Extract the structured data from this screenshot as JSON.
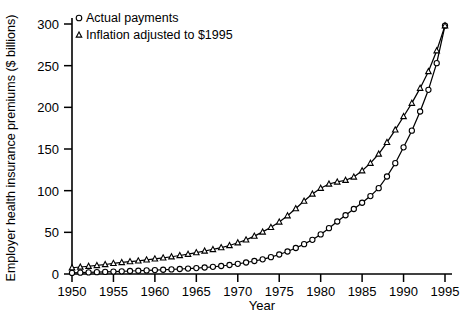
{
  "chart_data": {
    "type": "line",
    "title": "",
    "xlabel": "Year",
    "ylabel": "Employer health insurance premiums ($ billions)",
    "xlim": [
      1950,
      1995
    ],
    "ylim": [
      0,
      300
    ],
    "xticks": [
      1950,
      1955,
      1960,
      1965,
      1970,
      1975,
      1980,
      1985,
      1990,
      1995
    ],
    "yticks": [
      0,
      50,
      100,
      150,
      200,
      250,
      300
    ],
    "grid": false,
    "legend_position": "top-left",
    "x": [
      1950,
      1951,
      1952,
      1953,
      1954,
      1955,
      1956,
      1957,
      1958,
      1959,
      1960,
      1961,
      1962,
      1963,
      1964,
      1965,
      1966,
      1967,
      1968,
      1969,
      1970,
      1971,
      1972,
      1973,
      1974,
      1975,
      1976,
      1977,
      1978,
      1979,
      1980,
      1981,
      1982,
      1983,
      1984,
      1985,
      1986,
      1987,
      1988,
      1989,
      1990,
      1991,
      1992,
      1993,
      1994,
      1995
    ],
    "series": [
      {
        "name": "Actual payments",
        "marker": "circle",
        "values": [
          1.3,
          1.6,
          1.9,
          2.2,
          2.5,
          2.9,
          3.2,
          3.6,
          3.9,
          4.3,
          4.7,
          5.1,
          5.5,
          6.0,
          6.5,
          7.1,
          7.8,
          8.6,
          9.6,
          10.8,
          12.2,
          13.8,
          15.6,
          17.6,
          20.2,
          23.4,
          27.0,
          31.2,
          35.8,
          41.0,
          47.5,
          55.0,
          63.0,
          70.5,
          78.0,
          85.5,
          93.5,
          103.0,
          117.0,
          133.0,
          152.0,
          172.0,
          195.0,
          221.0,
          253.0,
          298.0
        ]
      },
      {
        "name": "Inflation adjusted to $1995",
        "marker": "triangle",
        "values": [
          7.5,
          8.4,
          9.3,
          10.3,
          11.4,
          12.8,
          13.9,
          14.9,
          15.8,
          17.0,
          18.2,
          19.4,
          20.7,
          22.2,
          23.8,
          25.7,
          27.6,
          29.5,
          31.7,
          34.2,
          37.5,
          41.0,
          45.5,
          50.5,
          56.0,
          62.5,
          70.0,
          78.5,
          87.5,
          96.0,
          103.0,
          108.0,
          110.5,
          112.5,
          116.5,
          124.0,
          133.0,
          144.0,
          158.0,
          173.0,
          189.0,
          205.0,
          223.0,
          243.0,
          268.0,
          298.0
        ]
      }
    ]
  },
  "legend": {
    "items": [
      {
        "label": "Actual payments",
        "marker": "circle"
      },
      {
        "label": "Inflation adjusted to $1995",
        "marker": "triangle"
      }
    ]
  }
}
